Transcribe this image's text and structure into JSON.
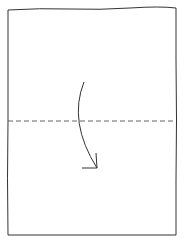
{
  "diagram": {
    "type": "fold-instruction",
    "description": "Valley fold: fold the top half of the sheet down along the horizontal center line",
    "sheet": {
      "x": 8,
      "y": 8,
      "width": 168,
      "height": 227,
      "stroke": "#333333"
    },
    "fold_line": {
      "style": "dashed",
      "y": 121,
      "x1": 8,
      "x2": 176,
      "stroke": "#555555"
    },
    "arrow": {
      "direction": "down",
      "start": [
        84,
        82
      ],
      "control": [
        68,
        122
      ],
      "end": [
        97,
        168
      ],
      "stroke": "#333333"
    }
  }
}
